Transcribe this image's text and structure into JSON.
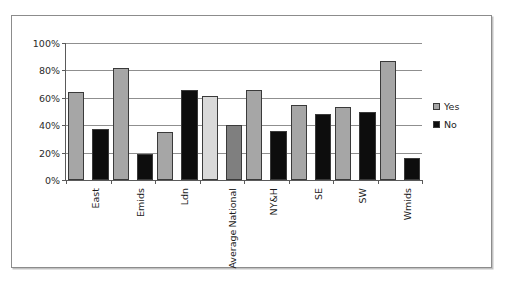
{
  "chart_data": {
    "type": "bar",
    "title": "",
    "xlabel": "",
    "ylabel": "",
    "ylim": [
      0,
      100
    ],
    "ytick_labels": [
      "0%",
      "20%",
      "40%",
      "60%",
      "80%",
      "100%"
    ],
    "ytick_values": [
      0,
      20,
      40,
      60,
      80,
      100
    ],
    "grid": true,
    "legend_position": "right",
    "categories": [
      "East",
      "Emids",
      "Ldn",
      "National Average",
      "NY&H",
      "SE",
      "SW",
      "Wmids"
    ],
    "category_lines": [
      [
        "East"
      ],
      [
        "Emids"
      ],
      [
        "Ldn"
      ],
      [
        "National",
        "Average"
      ],
      [
        "NY&H"
      ],
      [
        "SE"
      ],
      [
        "SW"
      ],
      [
        "Wmids"
      ]
    ],
    "series": [
      {
        "name": "Yes",
        "color": "#a6a6a6",
        "values": [
          64,
          82,
          35,
          61,
          66,
          55,
          53,
          87
        ]
      },
      {
        "name": "No",
        "color": "#0d0d0d",
        "values": [
          37,
          19,
          66,
          40,
          36,
          48,
          50,
          16
        ]
      }
    ],
    "highlight_category": "National Average",
    "highlight_colors": {
      "Yes": "#d9d9d9",
      "No": "#7f7f7f"
    }
  },
  "legend": {
    "items": [
      {
        "label": "Yes",
        "color": "#a6a6a6"
      },
      {
        "label": "No",
        "color": "#0d0d0d"
      }
    ]
  },
  "colors": {
    "frame": "#8c8c8c",
    "axis": "#5a5a5a",
    "gridline": "#8f8f8f",
    "bar_outline": "#3a3a3a",
    "background": "#ffffff"
  }
}
